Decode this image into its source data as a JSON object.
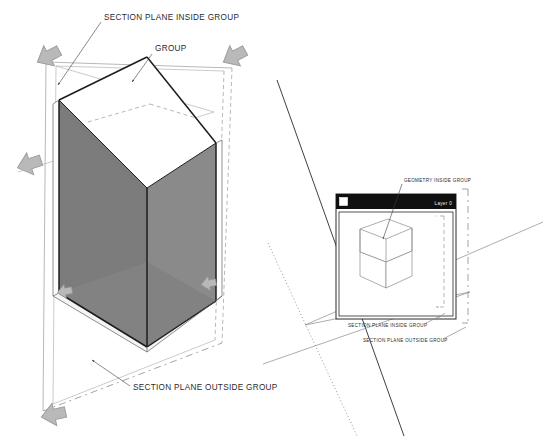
{
  "doc": {
    "title": "Section Plane Inside vs Outside Group",
    "background": "#ffffff"
  },
  "colors": {
    "ink": "#1c1c1c",
    "label_text": "#2b2b2b",
    "interior_wall_dark": "#7f7f7f",
    "interior_wall_light": "#8b8b8b",
    "cut_face_white": "#ffffff",
    "arrow_marker": "#b9b9b9",
    "window_titlebar": "#101010",
    "window_title_text": "#f2f2f2",
    "section_plane_edge": "#9a9a9a"
  },
  "left_figure": {
    "name": "cut-prism-figure",
    "annotations": [
      {
        "id": "section-plane-inside-group",
        "label": "SECTION PLANE INSIDE GROUP",
        "text_x": 104,
        "text_y": 18,
        "target_x": 58,
        "target_y": 85
      },
      {
        "id": "group",
        "label": "GROUP",
        "text_x": 155,
        "text_y": 50,
        "target_x": 132,
        "target_y": 82
      },
      {
        "id": "section-plane-outside-group",
        "label": "SECTION PLANE OUTSIDE GROUP",
        "text_x": 133,
        "text_y": 389,
        "target_x": 92,
        "target_y": 360
      }
    ],
    "section_plane_corner_markers": 5
  },
  "right_figure": {
    "name": "outliner-window-figure",
    "window": {
      "title_layer": "Layer 0",
      "checkbox_checked": false
    },
    "annotations": [
      {
        "id": "geometry-inside-group",
        "label": "GEOMETRY INSIDE GROUP",
        "text_x": 404,
        "text_y": 181,
        "target_x": 383,
        "target_y": 239
      },
      {
        "id": "section-plane-inside-group",
        "label": "SECTION PLANE INSIDE GROUP",
        "text_x": 348,
        "text_y": 325,
        "target_x": 438,
        "target_y": 311
      },
      {
        "id": "section-plane-outside-group",
        "label": "SECTION PLANE OUTSIDE GROUP",
        "text_x": 363,
        "text_y": 340,
        "target_x": 463,
        "target_y": 324
      }
    ]
  }
}
